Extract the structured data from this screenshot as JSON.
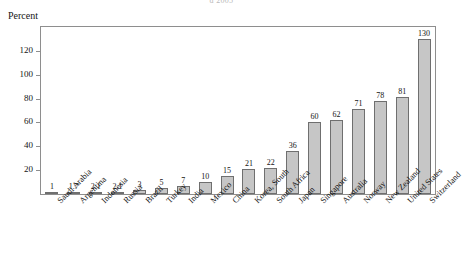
{
  "cut_title": "d 2005",
  "chart_data": {
    "type": "bar",
    "title": "",
    "subtitle": "",
    "xlabel": "",
    "ylabel": "Percent",
    "ylim": [
      0,
      140
    ],
    "ytick_step": 20,
    "yticks": [
      20,
      40,
      60,
      80,
      100,
      120
    ],
    "grid": false,
    "legend": "none",
    "bar_color": "#c6c6c6",
    "bar_border_color": "#6f6f6f",
    "categories": [
      "Saudi Arabia",
      "Argentina",
      "Indonesia",
      "Russia",
      "Brazil",
      "Turkey",
      "India",
      "Mexico",
      "China",
      "Korea, South",
      "South Africa",
      "Japan",
      "Singapore",
      "Australia",
      "Norway",
      "New Zealand",
      "United States",
      "Switzerland"
    ],
    "values": [
      1,
      1.7,
      2.1,
      2.1,
      3,
      5,
      7,
      10,
      15,
      21,
      22,
      36,
      60,
      62,
      71,
      78,
      81,
      130
    ],
    "value_labels": [
      "1",
      "1.7",
      "2.1",
      "2.1",
      "3",
      "5",
      "7",
      "10",
      "15",
      "21",
      "22",
      "36",
      "60",
      "62",
      "71",
      "78",
      "81",
      "130"
    ]
  }
}
